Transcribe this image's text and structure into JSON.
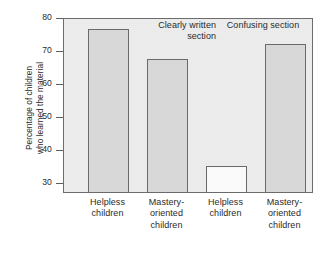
{
  "chart_data": {
    "type": "bar",
    "title": "",
    "xlabel": "",
    "ylabel": "Percentage of children who learned the material",
    "ylabel_lines": [
      "Percentage of children",
      "who learned the material"
    ],
    "ylim": [
      27,
      80
    ],
    "yticks": [
      30,
      40,
      50,
      60,
      70,
      80
    ],
    "ytick_labels": [
      "30",
      "40",
      "50",
      "60",
      "70",
      "80"
    ],
    "grid": false,
    "legend": "none",
    "categories": [
      "Helpless\nchildren",
      "Mastery-\noriented\nchildren",
      "Helpless\nchildren",
      "Mastery-\noriented\nchildren"
    ],
    "values": [
      77,
      68,
      35.5,
      72.5
    ],
    "bar_styles": [
      "filled",
      "filled",
      "hollow",
      "filled"
    ],
    "groups": [
      {
        "label": "Clearly written\nsection",
        "categories": [
          0,
          1
        ]
      },
      {
        "label": "Confusing section",
        "categories": [
          2,
          3
        ]
      }
    ],
    "colors": {
      "bar_fill": "#d9d9d9",
      "bar_hollow_fill": "#fbfbfb",
      "bar_stroke": "#6a6a6a",
      "plot_background": "#ededed",
      "axis": "#6d6d6d",
      "text": "#2a2a2a",
      "page_background": "#ffffff"
    }
  }
}
